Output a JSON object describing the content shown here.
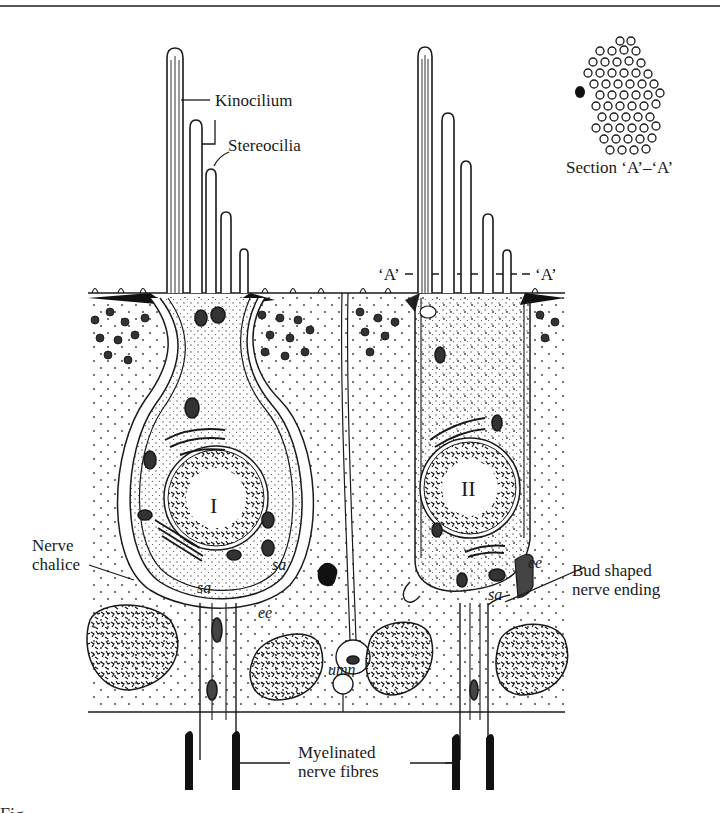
{
  "figure": {
    "labels": {
      "kinocilium": "Kinocilium",
      "stereocilia": "Stereocilia",
      "section_marker_left": "‘A’",
      "section_marker_right": "‘A’",
      "section_title": "Section ‘A’–‘A’",
      "nerve_chalice_line1": "Nerve",
      "nerve_chalice_line2": "chalice",
      "bud_line1": "Bud shaped",
      "bud_line2": "nerve ending",
      "myelinated_line1": "Myelinated",
      "myelinated_line2": "nerve fibres",
      "cell_type_1": "I",
      "cell_type_2": "II",
      "sa_1": "sa",
      "sa_2": "sa",
      "sa_3": "sa",
      "ee_1": "ee",
      "ee_2": "ee",
      "umn": "umn"
    },
    "caption_partial": "Fig."
  },
  "colors": {
    "ink": "#1a1a1a",
    "paper": "#ffffff",
    "rule": "#555555"
  }
}
